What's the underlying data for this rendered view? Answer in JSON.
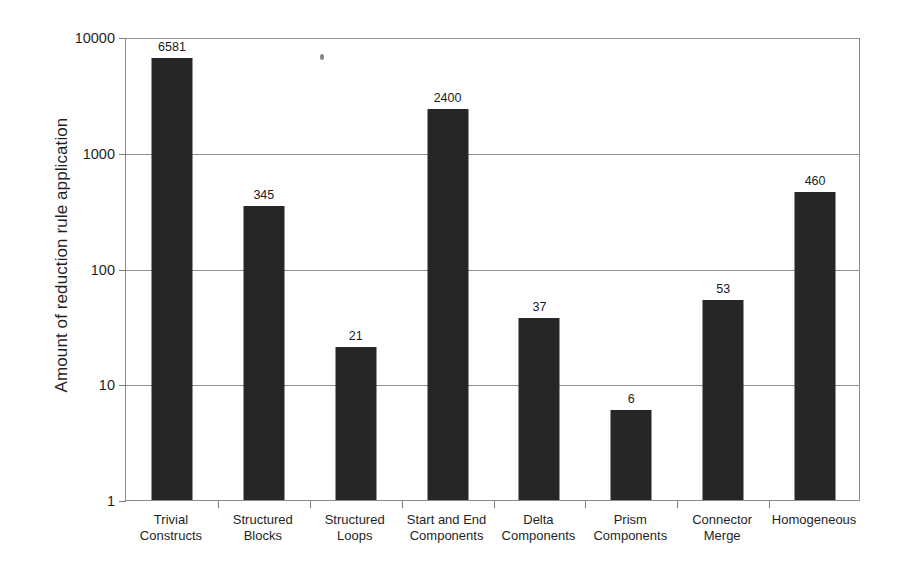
{
  "chart_data": {
    "type": "bar",
    "title": "",
    "xlabel": "",
    "ylabel": "Amount of reduction rule application",
    "yscale": "log",
    "ylim": [
      1,
      10000
    ],
    "y_ticks": [
      10000,
      1000,
      100,
      10,
      1
    ],
    "y_tick_labels": [
      "10000",
      "1000",
      "100",
      "10",
      "1"
    ],
    "grid": true,
    "legend": "none",
    "bar_color": "#262626",
    "categories": [
      "Trivial Constructs",
      "Structured Blocks",
      "Structured Loops",
      "Start and End Components",
      "Delta Components",
      "Prism Components",
      "Connector Merge",
      "Homogeneous"
    ],
    "category_lines": [
      [
        "Trivial",
        "Constructs"
      ],
      [
        "Structured",
        "Blocks"
      ],
      [
        "Structured",
        "Loops"
      ],
      [
        "Start and End",
        "Components"
      ],
      [
        "Delta",
        "Components"
      ],
      [
        "Prism",
        "Components"
      ],
      [
        "Connector",
        "Merge"
      ],
      [
        "Homogeneous",
        ""
      ]
    ],
    "values": [
      6581,
      345,
      21,
      2400,
      37,
      6,
      53,
      460
    ],
    "value_labels": [
      "6581",
      "345",
      "21",
      "2400",
      "37",
      "6",
      "53",
      "460"
    ]
  },
  "axes": {
    "y_title": "Amount of reduction rule application"
  },
  "artifacts": {
    "speck": "scan-speck"
  }
}
